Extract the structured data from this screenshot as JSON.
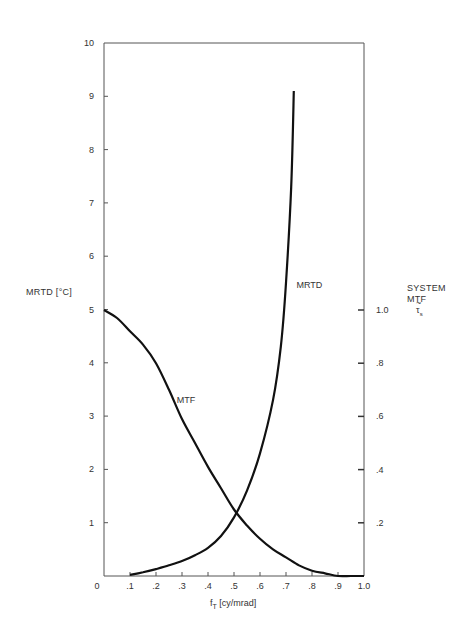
{
  "chart_data": {
    "type": "line",
    "title": "",
    "xlabel": "f_T [cy/mrad]",
    "xlabel_main": "f",
    "xlabel_sub": "T",
    "xlabel_unit": "[cy/mrad]",
    "ylabel_left": "MRTD [°C]",
    "ylabel_right": [
      "SYSTEM",
      "MTF",
      "τ̃s"
    ],
    "xlim": [
      0,
      1.0
    ],
    "ylim_left": [
      0,
      10
    ],
    "ylim_right": [
      0,
      1.0
    ],
    "grid": false,
    "x_ticks": [
      {
        "value": 0,
        "label": "0"
      },
      {
        "value": 0.1,
        "label": ".1"
      },
      {
        "value": 0.2,
        "label": ".2"
      },
      {
        "value": 0.3,
        "label": ".3"
      },
      {
        "value": 0.4,
        "label": ".4"
      },
      {
        "value": 0.5,
        "label": ".5"
      },
      {
        "value": 0.6,
        "label": ".6"
      },
      {
        "value": 0.7,
        "label": ".7"
      },
      {
        "value": 0.8,
        "label": ".8"
      },
      {
        "value": 0.9,
        "label": ".9"
      },
      {
        "value": 1.0,
        "label": "1.0"
      }
    ],
    "y_ticks_left": [
      {
        "value": 1,
        "label": "1"
      },
      {
        "value": 2,
        "label": "2"
      },
      {
        "value": 3,
        "label": "3"
      },
      {
        "value": 4,
        "label": "4"
      },
      {
        "value": 5,
        "label": "5"
      },
      {
        "value": 6,
        "label": "6"
      },
      {
        "value": 7,
        "label": "7"
      },
      {
        "value": 8,
        "label": "8"
      },
      {
        "value": 9,
        "label": "9"
      },
      {
        "value": 10,
        "label": "10"
      }
    ],
    "y_ticks_right": [
      {
        "value": 0.2,
        "label": ".2"
      },
      {
        "value": 0.4,
        "label": ".4"
      },
      {
        "value": 0.6,
        "label": ".6"
      },
      {
        "value": 0.8,
        "label": ".8"
      },
      {
        "value": 1.0,
        "label": "1.0"
      }
    ],
    "series": [
      {
        "name": "MRTD",
        "axis": "left",
        "label_pos": {
          "x": 0.74,
          "y": 5.4
        },
        "x": [
          0.1,
          0.15,
          0.2,
          0.25,
          0.3,
          0.35,
          0.4,
          0.45,
          0.5,
          0.55,
          0.6,
          0.65,
          0.68,
          0.7,
          0.72,
          0.73
        ],
        "values": [
          0.02,
          0.07,
          0.13,
          0.2,
          0.28,
          0.39,
          0.53,
          0.75,
          1.1,
          1.6,
          2.3,
          3.3,
          4.3,
          5.5,
          7.3,
          9.1
        ]
      },
      {
        "name": "MTF",
        "axis": "right",
        "label_pos": {
          "x": 0.28,
          "y": 0.65
        },
        "x": [
          0.0,
          0.05,
          0.1,
          0.15,
          0.2,
          0.25,
          0.3,
          0.35,
          0.4,
          0.45,
          0.5,
          0.55,
          0.6,
          0.65,
          0.7,
          0.75,
          0.8,
          0.85,
          0.9,
          0.95,
          1.0
        ],
        "values": [
          1.0,
          0.97,
          0.92,
          0.87,
          0.8,
          0.7,
          0.59,
          0.5,
          0.41,
          0.33,
          0.25,
          0.19,
          0.14,
          0.1,
          0.07,
          0.04,
          0.02,
          0.01,
          0.0,
          0.0,
          0.0
        ]
      }
    ]
  }
}
